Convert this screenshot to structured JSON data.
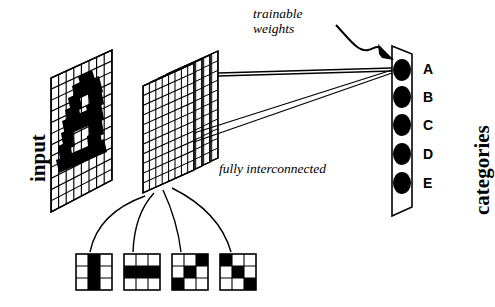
{
  "figure": {
    "background": "#ffffff",
    "ink": "#000000"
  },
  "labels": {
    "input": "input",
    "categories": "categories",
    "trainable_weights_line1": "trainable",
    "trainable_weights_line2": "weights",
    "fully_interconnected": "fully interconnected"
  },
  "categories": [
    {
      "id": "A",
      "label": "A"
    },
    {
      "id": "B",
      "label": "B"
    },
    {
      "id": "C",
      "label": "C"
    },
    {
      "id": "D",
      "label": "D"
    },
    {
      "id": "E",
      "label": "E"
    }
  ],
  "input_plane": {
    "name": "input-retina-grid",
    "cols": 8,
    "rows": 12,
    "pattern_note": "dark character bitmap on white grid"
  },
  "hidden_planes": {
    "name": "feature-map-stack",
    "count": 4,
    "cols": 8,
    "rows": 11
  },
  "kernels": [
    {
      "name": "vertical-bar-kernel",
      "cells": [
        [
          0,
          1,
          0
        ],
        [
          0,
          1,
          0
        ],
        [
          0,
          1,
          0
        ]
      ]
    },
    {
      "name": "horizontal-bar-kernel",
      "cells": [
        [
          0,
          0,
          0
        ],
        [
          1,
          1,
          1
        ],
        [
          0,
          0,
          0
        ]
      ]
    },
    {
      "name": "anti-diagonal-kernel",
      "cells": [
        [
          0,
          0,
          1
        ],
        [
          0,
          1,
          0
        ],
        [
          1,
          0,
          0
        ]
      ]
    },
    {
      "name": "diagonal-kernel",
      "cells": [
        [
          1,
          0,
          0
        ],
        [
          0,
          1,
          0
        ],
        [
          0,
          0,
          1
        ]
      ]
    }
  ],
  "connections": {
    "weight_line_count": 4,
    "fanout_curve_count": 4
  }
}
